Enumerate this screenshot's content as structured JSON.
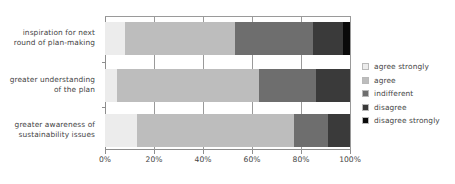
{
  "chart_data": {
    "type": "bar",
    "orientation": "horizontal",
    "stacked": true,
    "stack_mode": "percent",
    "title": "",
    "subtitle": "",
    "xlabel": "",
    "ylabel": "",
    "xlim": [
      0,
      100
    ],
    "xticks": [
      0,
      20,
      40,
      60,
      80,
      100
    ],
    "xtick_labels": [
      "0%",
      "20%",
      "40%",
      "60%",
      "80%",
      "100%"
    ],
    "grid": "vertical",
    "legend_position": "right",
    "categories": [
      "inspiration for next round of plan-making",
      "greater understanding of the plan",
      "greater awareness of sustainability issues"
    ],
    "category_lines": [
      [
        "inspiration for next",
        "round of plan-making"
      ],
      [
        "greater understanding",
        "of the plan"
      ],
      [
        "greater awareness of",
        "sustainability issues"
      ]
    ],
    "series": [
      {
        "name": "agree strongly",
        "color": "#ececec",
        "values": [
          8,
          5,
          13
        ]
      },
      {
        "name": "agree",
        "color": "#bdbdbd",
        "values": [
          45,
          58,
          64
        ]
      },
      {
        "name": "indifferent",
        "color": "#6e6e6e",
        "values": [
          32,
          23,
          14
        ]
      },
      {
        "name": "disagree",
        "color": "#3a3a3a",
        "values": [
          12,
          14,
          9
        ]
      },
      {
        "name": "disagree strongly",
        "color": "#0a0a0a",
        "values": [
          3,
          0,
          0
        ]
      }
    ]
  },
  "legend": {
    "items": [
      {
        "label": "agree strongly"
      },
      {
        "label": "agree"
      },
      {
        "label": "indifferent"
      },
      {
        "label": "disagree"
      },
      {
        "label": "disagree strongly"
      }
    ]
  },
  "axis": {
    "tick_labels": [
      "0%",
      "20%",
      "40%",
      "60%",
      "80%",
      "100%"
    ]
  }
}
